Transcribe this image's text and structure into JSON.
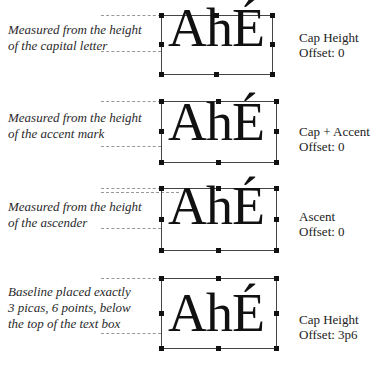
{
  "diagram": {
    "sample_text": "AhÉ",
    "panels": [
      {
        "caption": "Measured from the height\nof the capital letter",
        "setting": "Cap Height",
        "offset": "Offset: 0"
      },
      {
        "caption": "Measured from the height\nof the accent mark",
        "setting": "Cap + Accent",
        "offset": "Offset: 0"
      },
      {
        "caption": "Measured from the height\nof the ascender",
        "setting": "Ascent",
        "offset": "Offset: 0"
      },
      {
        "caption": "Baseline placed exactly\n3 picas, 6 points, below\nthe top of the text box",
        "setting": "Cap Height",
        "offset": "Offset: 3p6"
      }
    ]
  }
}
